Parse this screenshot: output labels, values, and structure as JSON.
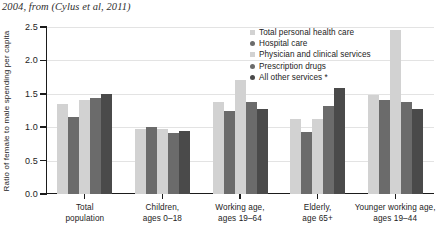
{
  "caption": "2004, from (Cylus et al, 2011)",
  "chart_data": {
    "type": "bar",
    "title": "",
    "xlabel": "",
    "ylabel": "Ratio of female to male spending per capita",
    "ylim": [
      0.0,
      2.5
    ],
    "ytick_labels": [
      "0.0",
      "0.5",
      "1.0",
      "1.5",
      "2.0",
      "2.5"
    ],
    "ytick_values": [
      0.0,
      0.5,
      1.0,
      1.5,
      2.0,
      2.5
    ],
    "grid": true,
    "legend_position": "inside-top-right",
    "categories": [
      "Total\npopulation",
      "Children,\nages 0–18",
      "Working age,\nages 19–64",
      "Elderly,\nage 65+",
      "Younger working age,\nages 19–44"
    ],
    "category_lines": [
      [
        "Total",
        "population"
      ],
      [
        "Children,",
        "ages 0–18"
      ],
      [
        "Working age,",
        "ages 19–64"
      ],
      [
        "Elderly,",
        "age 65+"
      ],
      [
        "Younger working age,",
        "ages 19–44"
      ]
    ],
    "series": [
      {
        "name": "Total personal health care",
        "color": "#d2d2d2",
        "values": [
          1.35,
          0.98,
          1.38,
          1.12,
          1.48
        ]
      },
      {
        "name": "Hospital care",
        "color": "#6b6b6b",
        "values": [
          1.16,
          1.01,
          1.25,
          0.93,
          1.4
        ]
      },
      {
        "name": "Physician and clinical services",
        "color": "#d2d2d2",
        "values": [
          1.4,
          0.97,
          1.7,
          1.13,
          2.45
        ]
      },
      {
        "name": "Prescription drugs",
        "color": "#6b6b6b",
        "values": [
          1.44,
          0.92,
          1.37,
          1.32,
          1.38
        ]
      },
      {
        "name": "All other services *",
        "color": "#4a4a4a",
        "values": [
          1.5,
          0.95,
          1.27,
          1.58,
          1.28
        ]
      }
    ]
  }
}
